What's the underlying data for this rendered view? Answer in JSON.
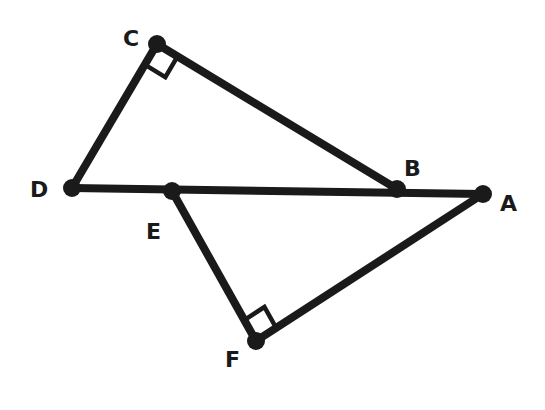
{
  "diagram": {
    "title": "",
    "points": [
      {
        "name": "C",
        "x": 157,
        "y": 44,
        "label_x": 123,
        "label_y": 46
      },
      {
        "name": "D",
        "x": 72,
        "y": 188,
        "label_x": 30,
        "label_y": 197
      },
      {
        "name": "E",
        "x": 172,
        "y": 191,
        "label_x": 146,
        "label_y": 239
      },
      {
        "name": "B",
        "x": 397,
        "y": 189,
        "label_x": 404,
        "label_y": 176
      },
      {
        "name": "A",
        "x": 483,
        "y": 194,
        "label_x": 500,
        "label_y": 211
      },
      {
        "name": "F",
        "x": 256,
        "y": 341,
        "label_x": 225,
        "label_y": 367
      }
    ],
    "segments": [
      [
        "C",
        "D"
      ],
      [
        "C",
        "B"
      ],
      [
        "D",
        "A"
      ],
      [
        "E",
        "F"
      ],
      [
        "F",
        "A"
      ]
    ],
    "right_angles": [
      {
        "vertex": "C",
        "between": [
          "D",
          "B"
        ]
      },
      {
        "vertex": "F",
        "between": [
          "E",
          "A"
        ]
      }
    ],
    "labels": {
      "C": "C",
      "D": "D",
      "E": "E",
      "B": "B",
      "A": "A",
      "F": "F"
    },
    "colors": {
      "stroke": "#1a1a1a",
      "background": "#ffffff"
    }
  }
}
